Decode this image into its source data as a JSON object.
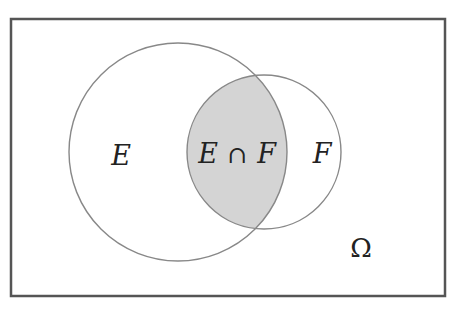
{
  "diagram": {
    "type": "venn",
    "universe_label": "Ω",
    "sets": [
      {
        "name": "E",
        "label": "E"
      },
      {
        "name": "F",
        "label": "F"
      }
    ],
    "intersection": {
      "label_left": "E",
      "operator": "∩",
      "label_right": "F",
      "shaded": true
    },
    "colors": {
      "border": "#555555",
      "circle_stroke": "#888888",
      "intersection_fill": "#d4d4d4",
      "background": "#ffffff",
      "text": "#222222"
    }
  }
}
